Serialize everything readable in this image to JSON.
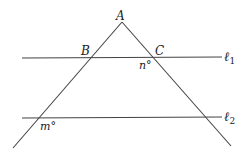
{
  "diagram": {
    "points": {
      "A": "A",
      "B": "B",
      "C": "C"
    },
    "lines": {
      "l1": "ℓ",
      "l1_sub": "1",
      "l2": "ℓ",
      "l2_sub": "2"
    },
    "angles": {
      "n": "n°",
      "m": "m°"
    },
    "colors": {
      "stroke": "#444444",
      "text": "#222222"
    }
  }
}
